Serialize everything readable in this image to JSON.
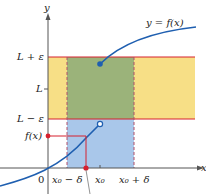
{
  "diagram": {
    "type": "epsilon-delta limit definition",
    "curve_label": "y = f(x)",
    "axis_labels": {
      "x": "x",
      "y": "y"
    },
    "origin_label": "0",
    "y_labels": {
      "upper": "L + ε",
      "mid": "L",
      "lower": "L − ε",
      "fx": "f(x)"
    },
    "x_labels": {
      "left": "x₀ − δ",
      "mid": "x₀",
      "right": "x₀ + δ"
    },
    "colors": {
      "yellow_band": "#f7df86",
      "green_region": "#9bb37a",
      "blue_region": "#a9c7ea",
      "curve": "#1f5fb0",
      "red": "#d6202f",
      "axis": "#555555"
    }
  }
}
